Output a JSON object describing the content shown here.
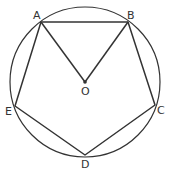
{
  "diagram": {
    "type": "geometry",
    "circle": {
      "center": "O",
      "cx": 85,
      "cy": 82,
      "r": 75
    },
    "points": {
      "A": {
        "label": "A",
        "x": 41,
        "y": 22
      },
      "B": {
        "label": "B",
        "x": 128,
        "y": 22
      },
      "C": {
        "label": "C",
        "x": 155,
        "y": 105
      },
      "D": {
        "label": "D",
        "x": 85,
        "y": 155
      },
      "E": {
        "label": "E",
        "x": 15,
        "y": 106
      },
      "O": {
        "label": "O",
        "x": 85,
        "y": 82
      }
    },
    "segments": [
      "AB",
      "BC",
      "CD",
      "DE",
      "EA",
      "OA",
      "OB"
    ],
    "stroke_color": "#333333"
  }
}
